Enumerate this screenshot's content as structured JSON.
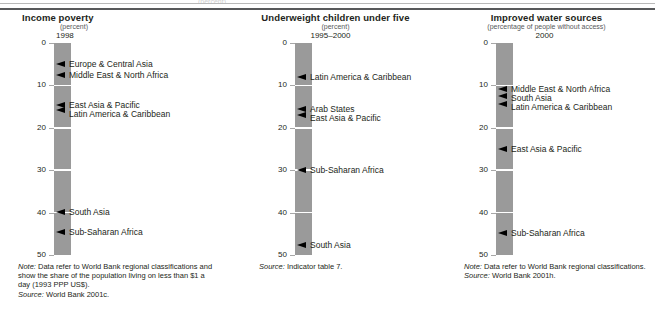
{
  "page": {
    "ghost_text": "(percent)"
  },
  "charts": [
    {
      "id": "income-poverty",
      "title": "Income poverty",
      "unit": "(percent)",
      "period": "1998",
      "axis_ticks": [
        "0",
        "10",
        "20",
        "30",
        "40",
        "50"
      ],
      "markers": [
        {
          "label": "Europe & Central Asia",
          "value": 5.0
        },
        {
          "label": "Middle East & North Africa",
          "value": 7.6
        },
        {
          "label": "East Asia & Pacific",
          "value": 14.8
        },
        {
          "label": "Latin America & Caribbean",
          "value": 15.9
        },
        {
          "label": "South Asia",
          "value": 40.0
        },
        {
          "label": "Sub-Saharan Africa",
          "value": 44.7
        }
      ],
      "note_label": "Note:",
      "note_text": " Data refer to World Bank regional classifications and show the share of the population living on less than $1 a day (1993 PPP US$).",
      "source_label": "Source:",
      "source_text": " World Bank 2001c."
    },
    {
      "id": "underweight-children-under-five",
      "title": "Underweight children under five",
      "unit": "(percent)",
      "period": "1995–2000",
      "axis_ticks": [
        "0",
        "10",
        "20",
        "30",
        "40",
        "50"
      ],
      "markers": [
        {
          "label": "Latin America & Caribbean",
          "value": 8.2
        },
        {
          "label": "Arab States",
          "value": 15.6
        },
        {
          "label": "East Asia & Pacific",
          "value": 17.0
        },
        {
          "label": "Sub-Saharan Africa",
          "value": 30.0
        },
        {
          "label": "South Asia",
          "value": 47.8
        }
      ],
      "note_label": "",
      "note_text": "",
      "source_label": "Source:",
      "source_text": " Indicator table 7."
    },
    {
      "id": "improved-water-sources",
      "title": "Improved water sources",
      "unit": "(percentage of people without access)",
      "period": "2000",
      "axis_ticks": [
        "0",
        "10",
        "20",
        "30",
        "40",
        "50"
      ],
      "markers": [
        {
          "label": "Middle East & North Africa",
          "value": 11.0
        },
        {
          "label": "South Asia",
          "value": 12.6
        },
        {
          "label": "Latin America & Caribbean",
          "value": 14.6
        },
        {
          "label": "East Asia & Pacific",
          "value": 25.0
        },
        {
          "label": "Sub-Saharan Africa",
          "value": 45.0
        }
      ],
      "note_label": "Note:",
      "note_text": " Data refer to World Bank regional classifications.",
      "source_label": "Source:",
      "source_text": " World Bank 2001h."
    }
  ],
  "chart_data": [
    {
      "type": "bar",
      "title": "Income poverty",
      "subtitle": "(percent)",
      "period": "1998",
      "ylabel": "percent",
      "xlabel": "",
      "ylim": [
        0,
        50
      ],
      "yticks": [
        0,
        10,
        20,
        30,
        40,
        50
      ],
      "grid": false,
      "legend": "none",
      "orientation": "vertical-strip-with-pointer-annotations",
      "categories": [
        "Europe & Central Asia",
        "Middle East & North Africa",
        "East Asia & Pacific",
        "Latin America & Caribbean",
        "South Asia",
        "Sub-Saharan Africa"
      ],
      "values": [
        5.0,
        7.6,
        14.8,
        15.9,
        40.0,
        44.7
      ],
      "note": "Note: Data refer to World Bank regional classifications and show the share of the population living on less than $1 a day (1993 PPP US$).",
      "source": "Source: World Bank 2001c."
    },
    {
      "type": "bar",
      "title": "Underweight children under five",
      "subtitle": "(percent)",
      "period": "1995–2000",
      "ylabel": "percent",
      "xlabel": "",
      "ylim": [
        0,
        50
      ],
      "yticks": [
        0,
        10,
        20,
        30,
        40,
        50
      ],
      "grid": false,
      "legend": "none",
      "orientation": "vertical-strip-with-pointer-annotations",
      "categories": [
        "Latin America & Caribbean",
        "Arab States",
        "East Asia & Pacific",
        "Sub-Saharan Africa",
        "South Asia"
      ],
      "values": [
        8.2,
        15.6,
        17.0,
        30.0,
        47.8
      ],
      "note": "",
      "source": "Source: Indicator table 7."
    },
    {
      "type": "bar",
      "title": "Improved water sources",
      "subtitle": "(percentage of people without access)",
      "period": "2000",
      "ylabel": "percentage of people without access",
      "xlabel": "",
      "ylim": [
        0,
        50
      ],
      "yticks": [
        0,
        10,
        20,
        30,
        40,
        50
      ],
      "grid": false,
      "legend": "none",
      "orientation": "vertical-strip-with-pointer-annotations",
      "categories": [
        "Middle East & North Africa",
        "South Asia",
        "Latin America & Caribbean",
        "East Asia & Pacific",
        "Sub-Saharan Africa"
      ],
      "values": [
        11.0,
        12.6,
        14.6,
        25.0,
        45.0
      ],
      "note": "Note: Data refer to World Bank regional classifications.",
      "source": "Source: World Bank 2001h."
    }
  ]
}
